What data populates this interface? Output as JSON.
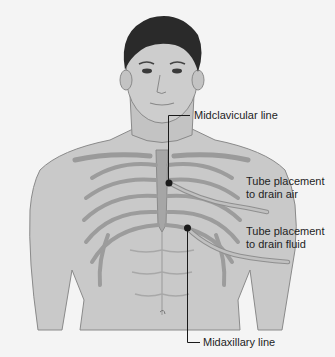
{
  "figure": {
    "colors": {
      "background": "#f4f4f4",
      "skin": "#c9c9c9",
      "skin_shadow": "#a9a9a9",
      "hair": "#2a2a2a",
      "bone": "#9a9a9a",
      "tube": "#b5b5b5",
      "leader": "#1a1a1a"
    }
  },
  "labels": {
    "midclavicular": "Midclavicular line",
    "tube_air_1": "Tube placement",
    "tube_air_2": "to drain air",
    "tube_fluid_1": "Tube placement",
    "tube_fluid_2": "to drain fluid",
    "midaxillary": "Midaxillary line"
  }
}
